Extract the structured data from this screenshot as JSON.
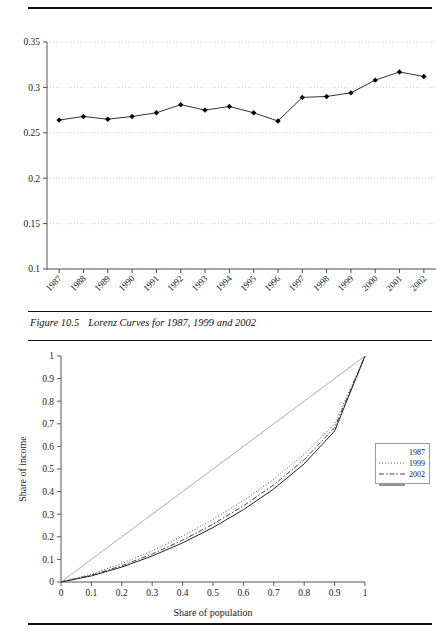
{
  "caption": {
    "figure_number": "Figure 10.5",
    "text": "Lorenz Curves for 1987, 1999 and 2002"
  },
  "chart_data": [
    {
      "type": "line",
      "name": "gini-coefficient-trend",
      "title": "",
      "xlabel": "",
      "ylabel": "",
      "categories": [
        "1987",
        "1988",
        "1989",
        "1990",
        "1991",
        "1992",
        "1993",
        "1994",
        "1995",
        "1996",
        "1997",
        "1998",
        "1999",
        "2000",
        "2001",
        "2002"
      ],
      "values": [
        0.264,
        0.268,
        0.265,
        0.268,
        0.272,
        0.281,
        0.275,
        0.279,
        0.272,
        0.263,
        0.289,
        0.29,
        0.294,
        0.308,
        0.317,
        0.312
      ],
      "ylim": [
        0.1,
        0.35
      ],
      "yticks": [
        "0.1",
        "0.15",
        "0.2",
        "0.25",
        "0.3",
        "0.35"
      ],
      "ytick_values": [
        0.1,
        0.15,
        0.2,
        0.25,
        0.3,
        0.35
      ],
      "grid": true,
      "marker": "diamond",
      "line_color": "#333333",
      "marker_color": "#000000"
    },
    {
      "type": "line",
      "name": "lorenz-curves",
      "title": "",
      "xlabel": "Share of population",
      "ylabel": "Share of income",
      "xlim": [
        0,
        1
      ],
      "ylim": [
        0,
        1
      ],
      "xticks": [
        "0",
        "0.1",
        "0.2",
        "0.3",
        "0.4",
        "0.5",
        "0.6",
        "0.7",
        "0.8",
        "0.9",
        "1"
      ],
      "xtick_values": [
        0,
        0.1,
        0.2,
        0.3,
        0.4,
        0.5,
        0.6,
        0.7,
        0.8,
        0.9,
        1
      ],
      "yticks": [
        "0",
        "0.1",
        "0.2",
        "0.3",
        "0.4",
        "0.5",
        "0.6",
        "0.7",
        "0.8",
        "0.9",
        "1"
      ],
      "ytick_values": [
        0,
        0.1,
        0.2,
        0.3,
        0.4,
        0.5,
        0.6,
        0.7,
        0.8,
        0.9,
        1
      ],
      "grid": false,
      "legend_position": "right",
      "x": [
        0,
        0.1,
        0.2,
        0.3,
        0.4,
        0.5,
        0.6,
        0.7,
        0.8,
        0.9,
        1
      ],
      "series": [
        {
          "name": "1987",
          "style": "dotted",
          "color": "#555555",
          "values": [
            0,
            0.035,
            0.082,
            0.138,
            0.203,
            0.277,
            0.36,
            0.455,
            0.565,
            0.7,
            1
          ]
        },
        {
          "name": "1999",
          "style": "dash-dot",
          "color": "#444444",
          "values": [
            0,
            0.03,
            0.072,
            0.124,
            0.185,
            0.256,
            0.337,
            0.43,
            0.541,
            0.683,
            1
          ]
        },
        {
          "name": "2002",
          "style": "solid",
          "color": "#222222",
          "values": [
            0,
            0.027,
            0.066,
            0.115,
            0.173,
            0.241,
            0.32,
            0.412,
            0.523,
            0.668,
            1
          ]
        },
        {
          "name": "equality-line",
          "style": "solid-thin",
          "color": "#888888",
          "values": [
            0,
            0.1,
            0.2,
            0.3,
            0.4,
            0.5,
            0.6,
            0.7,
            0.8,
            0.9,
            1
          ]
        }
      ],
      "legend_entries": [
        "1987",
        "1999",
        "2002"
      ]
    }
  ]
}
